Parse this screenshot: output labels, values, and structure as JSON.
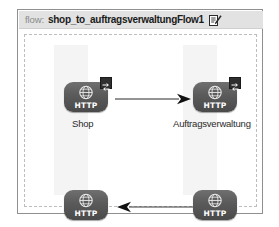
{
  "panel": {
    "header": {
      "keyword": "flow:",
      "name": "shop_to_auftragsverwaltungFlow1",
      "edit_icon": "edit-pencil-icon"
    }
  },
  "canvas": {
    "nodes": [
      {
        "id": "shop",
        "type_label": "HTTP",
        "icon": "globe-icon",
        "badge": "exchange-badge-icon",
        "has_badge": true,
        "caption": "Shop"
      },
      {
        "id": "auftragsverwaltung",
        "type_label": "HTTP",
        "icon": "globe-icon",
        "badge": "exchange-badge-icon",
        "has_badge": true,
        "caption": "Auftragsverwaltung"
      },
      {
        "id": "bottom-left",
        "type_label": "HTTP",
        "icon": "globe-icon",
        "has_badge": false,
        "caption": ""
      },
      {
        "id": "bottom-right",
        "type_label": "HTTP",
        "icon": "globe-icon",
        "has_badge": false,
        "caption": ""
      }
    ],
    "connectors": [
      {
        "id": "top",
        "direction": "right",
        "from": "shop",
        "to": "auftragsverwaltung"
      },
      {
        "id": "bottom",
        "direction": "left",
        "from": "bottom-right",
        "to": "bottom-left"
      }
    ]
  },
  "colors": {
    "node_fill": "#5a5a5a",
    "node_text": "#ffffff",
    "header_band": "#e2e2e2",
    "canvas_border": "#bdbdbd",
    "panel_border": "#8f8f8f",
    "lane": "#f4f4f4",
    "connector": "#2b2b2b"
  }
}
